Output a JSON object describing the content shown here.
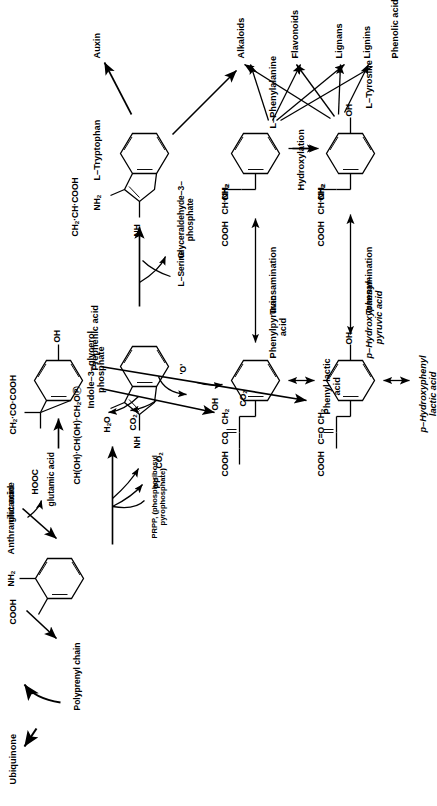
{
  "diagram": {
    "orientation": "rotated-90-ccw",
    "background": "#ffffff",
    "ink": "#000000"
  },
  "compounds": {
    "prephenic_acid": {
      "name": "Prephenic acid",
      "formula_left": "HOOC",
      "formula_top": "CH",
      "formula_top_sub": "2",
      "formula_top_tail": "·CO·COOH",
      "ring_substituent": "OH"
    },
    "anthranilic_acid": {
      "name": "Anthranilic acid",
      "sub_cooh": "COOH",
      "sub_nh2": "NH",
      "sub_nh2_sub": "2"
    },
    "indole_glycerol_phosphate": {
      "name_line1": "Indole–3–glycerol",
      "name_line2": "phosphate",
      "side_chain": "CH(OH)·CH(OH)·CH",
      "side_chain_sub": "2",
      "side_chain_tail": "O",
      "phosphate_glyph": "Ⓟ",
      "ring_nh": "NH"
    },
    "tryptophan": {
      "name": "L–Tryptophan",
      "side_chain": "CH",
      "side_chain_sub": "2",
      "side_chain_tail": "·CH·COOH",
      "amino": "NH",
      "amino_sub": "2",
      "ring_nh": "NH"
    },
    "phenylpyruvic_acid": {
      "name_line1": "Phenylpyruvic",
      "name_line2": "acid",
      "sub_cooh": "COOH",
      "sub_co": "CO",
      "sub_ch2": "CH",
      "sub_ch2_sub": "2"
    },
    "phenyl_lactic_acid": {
      "name_line1": "Phenyl lactic",
      "name_line2": "acid"
    },
    "phenylalanine": {
      "name": "L–Phenylalanine",
      "sub_cooh": "COOH",
      "sub_chnh2": "CH·NH",
      "sub_chnh2_sub": "2",
      "sub_ch2": "CH",
      "sub_ch2_sub": "2"
    },
    "hydroxyphenylpyruvic_acid": {
      "name_line1": "p–Hydroxyphenyl–",
      "name_line2": "pyruvic acid",
      "sub_cooh": "COOH",
      "sub_co": "C=O",
      "sub_ch2": "CH",
      "sub_ch2_sub": "2",
      "ring_substituent": "OH"
    },
    "hydroxyphenyl_lactic_acid": {
      "name_line1": "p–Hydroxyphenyl",
      "name_line2": "lactic acid"
    },
    "tyrosine": {
      "name": "L–Tyrosine",
      "sub_cooh": "COOH",
      "sub_chnh2": "CH·NH",
      "sub_chnh2_sub": "2",
      "sub_ch2": "CH",
      "sub_ch2_sub": "2",
      "ring_substituent": "OH"
    }
  },
  "cofactors": {
    "glutamine": "glutamine",
    "glutamic_acid": "glutamic acid",
    "prpp_line1": "PRPP, (phosphoribosyl",
    "prpp_line2": "pyrophosphate)",
    "ppi": "PP",
    "ppi_sub": "i",
    "co2": "CO",
    "co2_sub": "2",
    "serine": "L–Serine",
    "gap_line1": "Glyceraldehyde–3–",
    "gap_line2": "phosphate",
    "water": "H",
    "water_sub": "2",
    "water_tail": "O",
    "oxygen": "O",
    "hydroxyl": "OH"
  },
  "reactions": {
    "transamination_1": "Transamination",
    "transamination_2": "Transamination",
    "hydroxylation": "Hydroxylation",
    "polyprenyl_chain": "Polyprenyl chain"
  },
  "products": {
    "ubiquinone": "Ubiquinone",
    "auxin": "Auxin",
    "alkaloids": "Alkaloids",
    "flavonoids": "Flavonoids",
    "lignans": "Lignans",
    "lignins": "Lignins",
    "phenolic_acids": "Phenolic acids"
  }
}
